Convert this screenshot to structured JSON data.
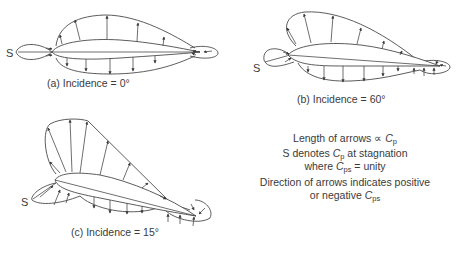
{
  "diagrams": [
    {
      "id": "a",
      "caption": "(a) Incidence = 0°",
      "stagnation_label": "S"
    },
    {
      "id": "b",
      "caption": "(b) Incidence = 60°",
      "stagnation_label": "S"
    },
    {
      "id": "c",
      "caption": "(c) Incidence = 15°",
      "stagnation_label": "S"
    }
  ],
  "legend": {
    "line1_text": "Length of arrows ∝ ",
    "line1_symbol": "C",
    "line1_sub": "p",
    "line2_prefix": "S denotes ",
    "line2_symbol": "C",
    "line2_sub": "p",
    "line2_suffix": " at stagnation",
    "line3_prefix": "where ",
    "line3_symbol": "C",
    "line3_sub": "ps",
    "line3_suffix": " = unity",
    "line4_text": "Direction of arrows indicates positive",
    "line5_prefix": "or negative ",
    "line5_symbol": "C",
    "line5_sub": "ps"
  },
  "colors": {
    "ink": "#4a4a4a",
    "background": "#ffffff"
  }
}
